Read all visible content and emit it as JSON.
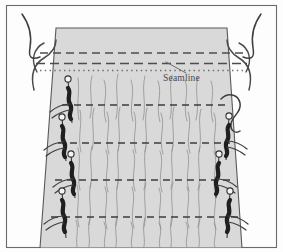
{
  "figure": {
    "canvas": {
      "width": 283,
      "height": 252
    },
    "background_color": "#fdfdfd",
    "frame": {
      "border_color": "#6b6b6b",
      "inset": {
        "x": 6,
        "y": 5,
        "width": 271,
        "height": 243
      }
    },
    "fabric": {
      "fill_color": "#d9d9d9",
      "stroke_color": "#5a5a5a",
      "description": "Light gray fabric panel flaring outward toward the bottom"
    },
    "labels": {
      "seamline": "Seamline"
    },
    "leader_line": {
      "from": {
        "x": 188,
        "y": 72
      },
      "to": {
        "x": 168,
        "y": 62
      },
      "color": "#6b6b6b"
    },
    "marking_rows": {
      "top_dash_color": "#4d4d4d",
      "dotted_color": "#6b6b6b",
      "rows": [
        {
          "name": "upper-dashed-edge",
          "y": 53,
          "style": "dashed"
        },
        {
          "name": "lower-dashed-edge",
          "y": 63,
          "style": "dashed"
        },
        {
          "name": "seamline-dotted",
          "y": 70,
          "style": "dotted"
        }
      ]
    },
    "gather_rows": [
      {
        "name": "gather-stitch-row-1",
        "y": 105
      },
      {
        "name": "gather-stitch-row-2",
        "y": 143
      },
      {
        "name": "gather-stitch-row-3",
        "y": 180
      },
      {
        "name": "gather-stitch-row-4",
        "y": 217
      }
    ],
    "pins": {
      "head_fill": "#f4f4f4",
      "head_stroke": "#3a3a3a",
      "body_color": "#262626",
      "left": [
        {
          "name": "pin-left-1",
          "x": 68,
          "y": 80
        },
        {
          "name": "pin-left-2",
          "x": 62,
          "y": 118
        },
        {
          "name": "pin-left-3",
          "x": 71,
          "y": 155
        },
        {
          "name": "pin-left-4",
          "x": 62,
          "y": 192
        }
      ],
      "right": [
        {
          "name": "pin-right-1",
          "x": 229,
          "y": 117
        },
        {
          "name": "pin-right-2",
          "x": 219,
          "y": 155
        },
        {
          "name": "pin-right-3",
          "x": 230,
          "y": 192
        }
      ]
    },
    "threads": {
      "color": "#3f3f3f",
      "left_tail": "curved thread tail hanging at upper left",
      "right_tail": "curved thread tail hanging at upper right",
      "right_loop": "looped gathering thread at right center"
    }
  }
}
